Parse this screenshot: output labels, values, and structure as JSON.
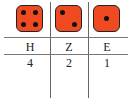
{
  "dice": [
    {
      "column": "H",
      "value": 4
    },
    {
      "column": "Z",
      "value": 2
    },
    {
      "column": "E",
      "value": 1
    }
  ],
  "table": {
    "headers": [
      "H",
      "Z",
      "E"
    ],
    "values": [
      "4",
      "2",
      "1"
    ]
  },
  "colors": {
    "die_fill": "#f04a23",
    "pip": "#111111",
    "border": "#222222"
  }
}
